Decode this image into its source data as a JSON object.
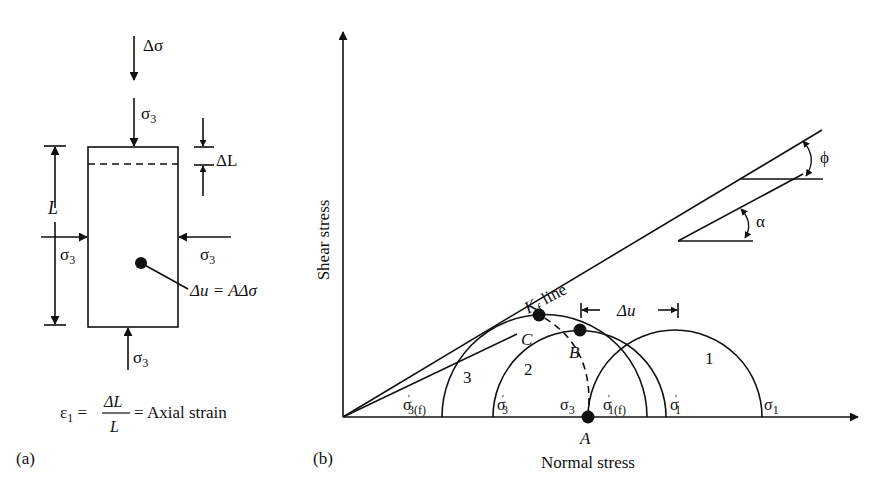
{
  "panel_a": {
    "label": "(a)",
    "load_top": "Δσ",
    "confining_top": "σ",
    "confining_top_sub": "3",
    "confining_left": "σ",
    "confining_left_sub": "3",
    "confining_right": "σ",
    "confining_right_sub": "3",
    "confining_bottom": "σ",
    "confining_bottom_sub": "3",
    "length_label": "L",
    "delta_length_label": "ΔL",
    "pore_pressure_label": "Δu = AΔσ",
    "strain_formula": {
      "lhs": "ε",
      "lhs_sub": "1",
      "numerator": "ΔL",
      "denominator": "L",
      "rhs": "= Axial strain"
    }
  },
  "panel_b": {
    "label": "(b)",
    "y_axis_label": "Shear stress",
    "x_axis_label": "Normal stress",
    "kf_line_label": "K",
    "kf_line_sub": "f",
    "kf_line_suffix": " line",
    "phi_label": "ϕ",
    "alpha_label": "α",
    "delta_u_label": "Δu",
    "circle_labels": [
      "1",
      "2",
      "3"
    ],
    "points": [
      "A",
      "B",
      "C"
    ],
    "axis_labels": {
      "sigma3f": {
        "main": "σ",
        "sub": "3(f)"
      },
      "sigma3p": {
        "main": "σ",
        "sub": "3"
      },
      "sigma3": {
        "main": "σ",
        "sub": "3"
      },
      "sigma1f": {
        "main": "σ",
        "sub": "1(f)"
      },
      "sigma1p": {
        "main": "σ",
        "sub": "1"
      },
      "sigma1": {
        "main": "σ",
        "sub": "1"
      }
    }
  },
  "colors": {
    "ink": "#111111",
    "background": "#ffffff"
  }
}
